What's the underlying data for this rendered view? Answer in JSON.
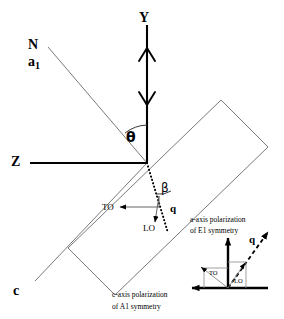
{
  "figure": {
    "type": "crystal-optics-scattering-geometry",
    "background_color": "#ffffff",
    "line_color": "#000000",
    "thin_line_color": "#555555"
  },
  "axes": {
    "y_label": "Y",
    "z_label": "Z",
    "normal_label": "N",
    "a_axis_label": "a",
    "a_axis_subscript": "1",
    "c_axis_label": "c"
  },
  "angles": {
    "theta": "θ",
    "beta": "β"
  },
  "vectors": {
    "q_label": "q",
    "to_label": "TO",
    "lo_label": "LO"
  },
  "inset": {
    "q_label": "q",
    "to_label": "TO",
    "lo_label": "LO",
    "caption_line1": "a-axis polarization",
    "caption_line2": "of E1 symmetry"
  },
  "captions": {
    "c_axis_line1": "c-axis polarization",
    "c_axis_line2": "of A1 symmetry"
  }
}
